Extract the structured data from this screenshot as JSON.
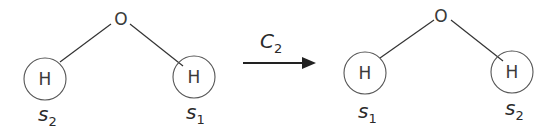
{
  "diagram": {
    "operation": {
      "symbol": "C",
      "subscript": "2"
    },
    "before": {
      "center_atom": "O",
      "left_atom": "H",
      "right_atom": "H",
      "left_label": {
        "symbol": "s",
        "subscript": "2"
      },
      "right_label": {
        "symbol": "s",
        "subscript": "1"
      }
    },
    "after": {
      "center_atom": "O",
      "left_atom": "H",
      "right_atom": "H",
      "left_label": {
        "symbol": "s",
        "subscript": "1"
      },
      "right_label": {
        "symbol": "s",
        "subscript": "2"
      }
    },
    "colors": {
      "line": "#333333",
      "circle": "#555555",
      "text": "#2a2a2a"
    }
  }
}
